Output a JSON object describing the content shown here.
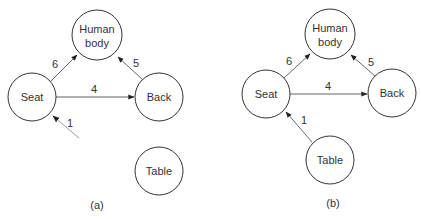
{
  "diagram_a": {
    "caption": "(a)",
    "nodes": {
      "human_body": {
        "line1": "Human",
        "line2": "body"
      },
      "seat": {
        "label": "Seat"
      },
      "back": {
        "label": "Back"
      },
      "table": {
        "label": "Table"
      }
    },
    "edges": {
      "seat_to_human": {
        "weight": "6"
      },
      "back_to_human": {
        "weight": "5"
      },
      "seat_to_back": {
        "weight": "4"
      },
      "external_to_seat": {
        "weight": "1"
      }
    }
  },
  "diagram_b": {
    "caption": "(b)",
    "nodes": {
      "human_body": {
        "line1": "Human",
        "line2": "body"
      },
      "seat": {
        "label": "Seat"
      },
      "back": {
        "label": "Back"
      },
      "table": {
        "label": "Table"
      }
    },
    "edges": {
      "seat_to_human": {
        "weight": "6"
      },
      "back_to_human": {
        "weight": "5"
      },
      "seat_to_back": {
        "weight": "4"
      },
      "table_to_seat": {
        "weight": "1"
      }
    }
  }
}
